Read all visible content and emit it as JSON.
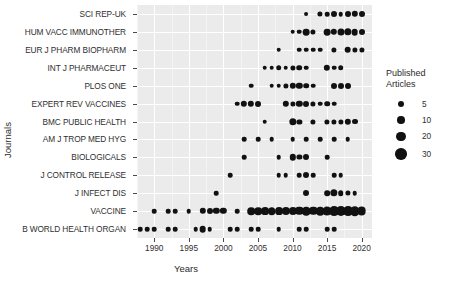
{
  "chart_data": {
    "type": "scatter",
    "title": "",
    "xlabel": "Years",
    "ylabel": "Journals",
    "xlim": [
      1987.5,
      2021.5
    ],
    "grid": true,
    "legend": {
      "title_line1": "Published",
      "title_line2": "Articles",
      "position": "right",
      "size_breaks": [
        5,
        10,
        20,
        30
      ],
      "size_labels": [
        "5",
        "10",
        "20",
        "30"
      ]
    },
    "size_encoding": "Published Articles (bubble area)",
    "point_color": "#111111",
    "panel_color": "#ebebeb",
    "grid_color": "#ffffff",
    "x_ticks": [
      1990,
      1995,
      2000,
      2005,
      2010,
      2015,
      2020
    ],
    "x_tick_labels": [
      "1990",
      "1995",
      "2000",
      "2005",
      "2010",
      "2015",
      "2020"
    ],
    "categories": [
      "SCI REP-UK",
      "HUM VACC IMMUNOTHER",
      "EUR J PHARM BIOPHARM",
      "INT J PHARMACEUT",
      "PLOS ONE",
      "EXPERT REV VACCINES",
      "BMC PUBLIC HEALTH",
      "AM J TROP MED HYG",
      "BIOLOGICALS",
      "J CONTROL RELEASE",
      "J INFECT DIS",
      "VACCINE",
      "B WORLD HEALTH ORGAN"
    ],
    "series": [
      {
        "name": "SCI REP-UK",
        "points": [
          {
            "x": 2012,
            "y": 1
          },
          {
            "x": 2014,
            "y": 3
          },
          {
            "x": 2015,
            "y": 2
          },
          {
            "x": 2016,
            "y": 5
          },
          {
            "x": 2017,
            "y": 2
          },
          {
            "x": 2018,
            "y": 5
          },
          {
            "x": 2019,
            "y": 6
          },
          {
            "x": 2020,
            "y": 5
          }
        ]
      },
      {
        "name": "HUM VACC IMMUNOTHER",
        "points": [
          {
            "x": 2010,
            "y": 2
          },
          {
            "x": 2011,
            "y": 2
          },
          {
            "x": 2012,
            "y": 7
          },
          {
            "x": 2013,
            "y": 3
          },
          {
            "x": 2015,
            "y": 7
          },
          {
            "x": 2016,
            "y": 6
          },
          {
            "x": 2017,
            "y": 8
          },
          {
            "x": 2018,
            "y": 9
          },
          {
            "x": 2019,
            "y": 7
          },
          {
            "x": 2020,
            "y": 5
          }
        ]
      },
      {
        "name": "EUR J PHARM BIOPHARM",
        "points": [
          {
            "x": 2008,
            "y": 2
          },
          {
            "x": 2011,
            "y": 2
          },
          {
            "x": 2012,
            "y": 2
          },
          {
            "x": 2013,
            "y": 2
          },
          {
            "x": 2014,
            "y": 2
          },
          {
            "x": 2016,
            "y": 3
          },
          {
            "x": 2018,
            "y": 7
          },
          {
            "x": 2019,
            "y": 3
          },
          {
            "x": 2020,
            "y": 3
          }
        ]
      },
      {
        "name": "INT J PHARMACEUT",
        "points": [
          {
            "x": 2006,
            "y": 2
          },
          {
            "x": 2007,
            "y": 2
          },
          {
            "x": 2008,
            "y": 4
          },
          {
            "x": 2009,
            "y": 2
          },
          {
            "x": 2010,
            "y": 3
          },
          {
            "x": 2011,
            "y": 4
          },
          {
            "x": 2012,
            "y": 2
          },
          {
            "x": 2015,
            "y": 6
          },
          {
            "x": 2016,
            "y": 2
          },
          {
            "x": 2017,
            "y": 4
          }
        ]
      },
      {
        "name": "PLOS ONE",
        "points": [
          {
            "x": 2004,
            "y": 2
          },
          {
            "x": 2007,
            "y": 2
          },
          {
            "x": 2008,
            "y": 2
          },
          {
            "x": 2009,
            "y": 3
          },
          {
            "x": 2010,
            "y": 6
          },
          {
            "x": 2011,
            "y": 6
          },
          {
            "x": 2012,
            "y": 4
          },
          {
            "x": 2013,
            "y": 2
          },
          {
            "x": 2016,
            "y": 5
          },
          {
            "x": 2017,
            "y": 5
          },
          {
            "x": 2018,
            "y": 5
          }
        ]
      },
      {
        "name": "EXPERT REV VACCINES",
        "points": [
          {
            "x": 2002,
            "y": 2
          },
          {
            "x": 2003,
            "y": 6
          },
          {
            "x": 2004,
            "y": 6
          },
          {
            "x": 2005,
            "y": 5
          },
          {
            "x": 2009,
            "y": 6
          },
          {
            "x": 2010,
            "y": 3
          },
          {
            "x": 2011,
            "y": 6
          },
          {
            "x": 2012,
            "y": 5
          },
          {
            "x": 2013,
            "y": 3
          },
          {
            "x": 2014,
            "y": 2
          },
          {
            "x": 2015,
            "y": 4
          },
          {
            "x": 2016,
            "y": 2
          }
        ]
      },
      {
        "name": "BMC PUBLIC HEALTH",
        "points": [
          {
            "x": 2006,
            "y": 2
          },
          {
            "x": 2010,
            "y": 9
          },
          {
            "x": 2011,
            "y": 3
          },
          {
            "x": 2013,
            "y": 3
          },
          {
            "x": 2015,
            "y": 3
          },
          {
            "x": 2016,
            "y": 3
          },
          {
            "x": 2017,
            "y": 3
          },
          {
            "x": 2018,
            "y": 6
          },
          {
            "x": 2019,
            "y": 5
          }
        ]
      },
      {
        "name": "AM J TROP MED HYG",
        "points": [
          {
            "x": 2003,
            "y": 2
          },
          {
            "x": 2005,
            "y": 2
          },
          {
            "x": 2007,
            "y": 2
          },
          {
            "x": 2010,
            "y": 2
          },
          {
            "x": 2012,
            "y": 2
          },
          {
            "x": 2014,
            "y": 2
          },
          {
            "x": 2016,
            "y": 2
          },
          {
            "x": 2018,
            "y": 2
          }
        ]
      },
      {
        "name": "BIOLOGICALS",
        "points": [
          {
            "x": 2003,
            "y": 2
          },
          {
            "x": 2008,
            "y": 2
          },
          {
            "x": 2010,
            "y": 6
          },
          {
            "x": 2011,
            "y": 3
          },
          {
            "x": 2012,
            "y": 5
          },
          {
            "x": 2015,
            "y": 2
          }
        ]
      },
      {
        "name": "J CONTROL RELEASE",
        "points": [
          {
            "x": 2001,
            "y": 2
          },
          {
            "x": 2008,
            "y": 2
          },
          {
            "x": 2009,
            "y": 2
          },
          {
            "x": 2011,
            "y": 2
          },
          {
            "x": 2012,
            "y": 5
          },
          {
            "x": 2013,
            "y": 2
          },
          {
            "x": 2016,
            "y": 2
          },
          {
            "x": 2017,
            "y": 2
          }
        ]
      },
      {
        "name": "J INFECT DIS",
        "points": [
          {
            "x": 1999,
            "y": 2
          },
          {
            "x": 2012,
            "y": 5
          },
          {
            "x": 2015,
            "y": 4
          },
          {
            "x": 2016,
            "y": 9
          },
          {
            "x": 2017,
            "y": 4
          },
          {
            "x": 2018,
            "y": 3
          },
          {
            "x": 2019,
            "y": 2
          }
        ]
      },
      {
        "name": "VACCINE",
        "points": [
          {
            "x": 1990,
            "y": 2
          },
          {
            "x": 1992,
            "y": 2
          },
          {
            "x": 1993,
            "y": 2
          },
          {
            "x": 1995,
            "y": 2
          },
          {
            "x": 1997,
            "y": 6
          },
          {
            "x": 1998,
            "y": 5
          },
          {
            "x": 1999,
            "y": 6
          },
          {
            "x": 2000,
            "y": 6
          },
          {
            "x": 2002,
            "y": 2
          },
          {
            "x": 2004,
            "y": 10
          },
          {
            "x": 2005,
            "y": 10
          },
          {
            "x": 2006,
            "y": 11
          },
          {
            "x": 2007,
            "y": 10
          },
          {
            "x": 2008,
            "y": 11
          },
          {
            "x": 2009,
            "y": 12
          },
          {
            "x": 2010,
            "y": 12
          },
          {
            "x": 2011,
            "y": 13
          },
          {
            "x": 2012,
            "y": 14
          },
          {
            "x": 2013,
            "y": 13
          },
          {
            "x": 2014,
            "y": 14
          },
          {
            "x": 2015,
            "y": 16
          },
          {
            "x": 2016,
            "y": 20
          },
          {
            "x": 2017,
            "y": 22
          },
          {
            "x": 2018,
            "y": 20
          },
          {
            "x": 2019,
            "y": 18
          },
          {
            "x": 2020,
            "y": 15
          }
        ]
      },
      {
        "name": "B WORLD HEALTH ORGAN",
        "points": [
          {
            "x": 1988,
            "y": 2
          },
          {
            "x": 1989,
            "y": 2
          },
          {
            "x": 1990,
            "y": 2
          },
          {
            "x": 1992,
            "y": 2
          },
          {
            "x": 1993,
            "y": 2
          },
          {
            "x": 1996,
            "y": 2
          },
          {
            "x": 1997,
            "y": 7
          },
          {
            "x": 1998,
            "y": 2
          },
          {
            "x": 2001,
            "y": 2
          },
          {
            "x": 2002,
            "y": 2
          },
          {
            "x": 2004,
            "y": 2
          },
          {
            "x": 2005,
            "y": 2
          },
          {
            "x": 2008,
            "y": 2
          },
          {
            "x": 2011,
            "y": 2
          },
          {
            "x": 2012,
            "y": 2
          },
          {
            "x": 2015,
            "y": 2
          },
          {
            "x": 2016,
            "y": 2
          }
        ]
      }
    ]
  }
}
